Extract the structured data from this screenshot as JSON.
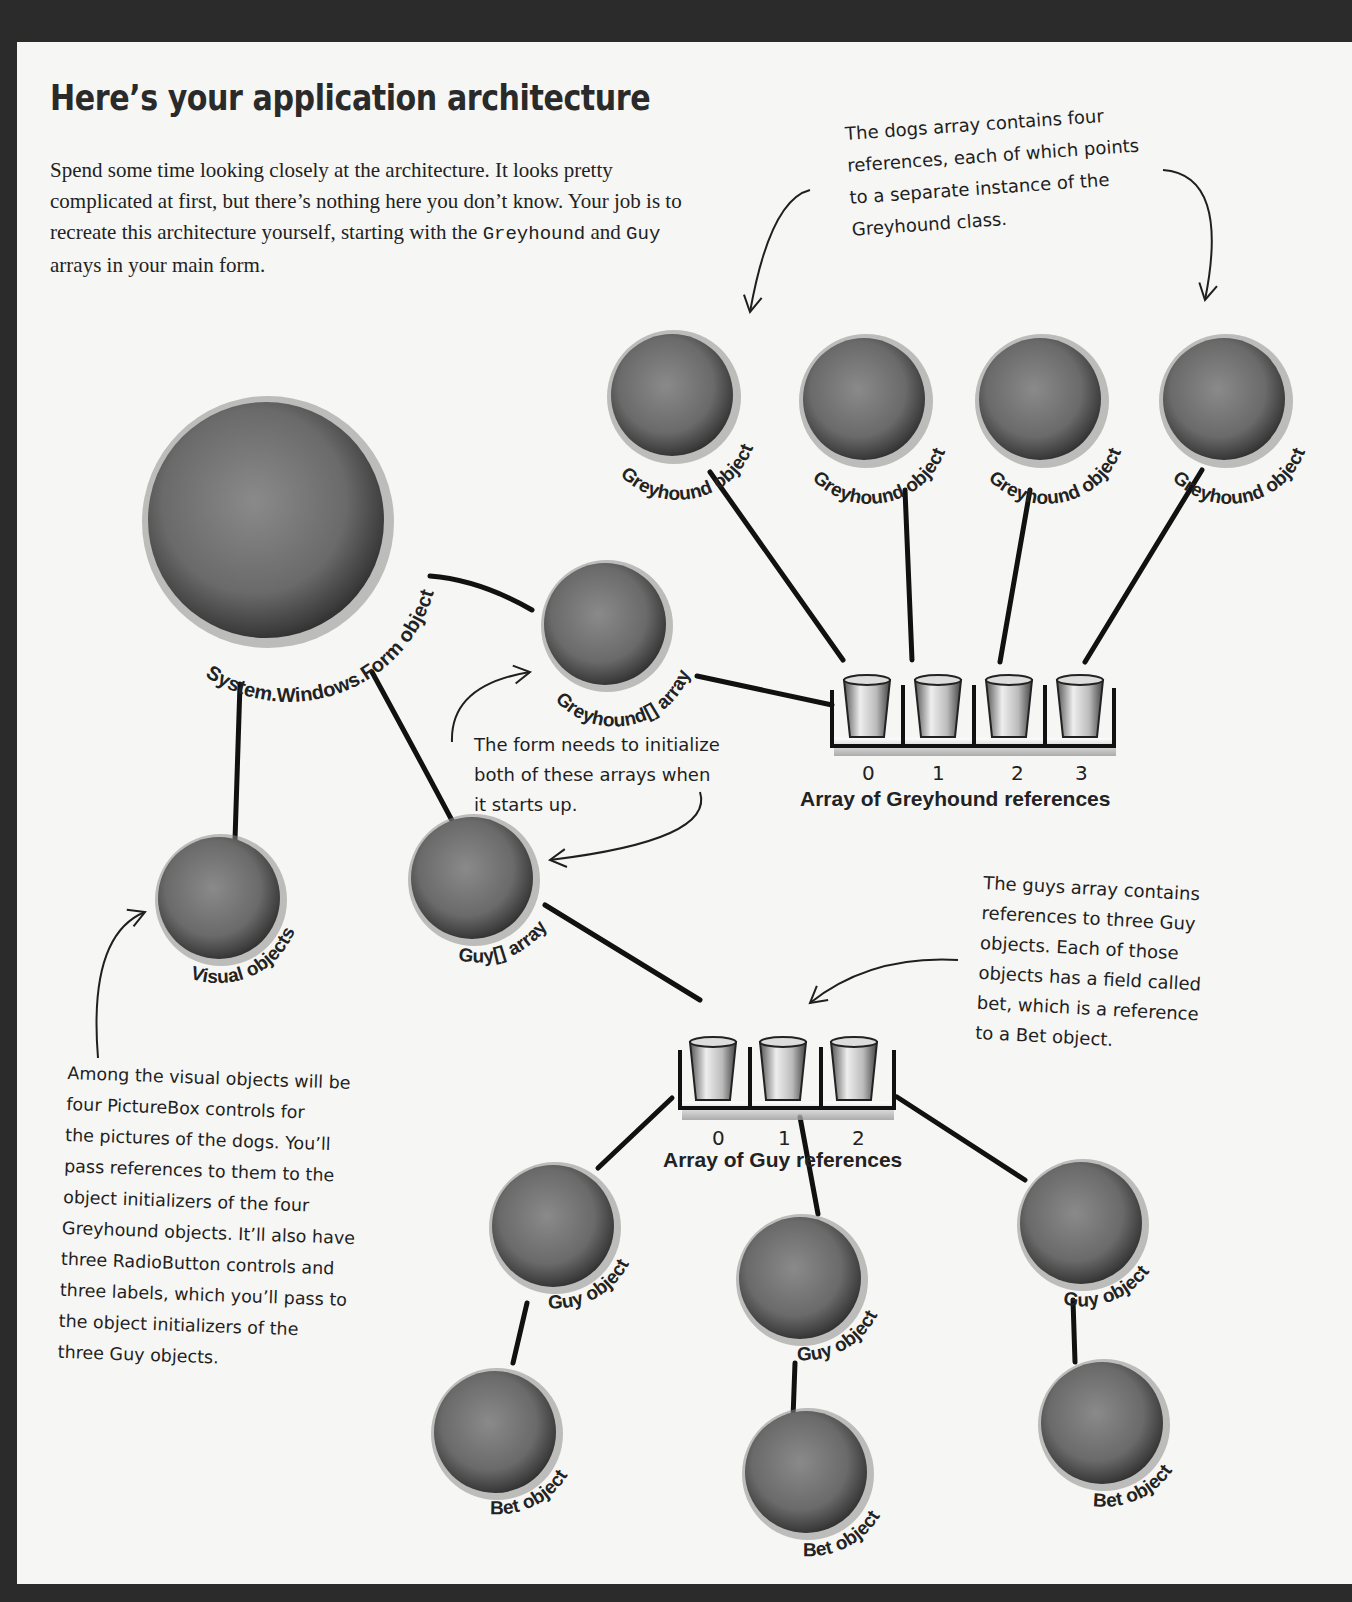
{
  "page": {
    "title": "Here’s your application architecture",
    "intro": {
      "part1": "Spend some time looking closely at the architecture. It looks pretty complicated at first, but there’s nothing here you don’t know. Your job is to recreate this architecture yourself, starting with the ",
      "code1": "Greyhound",
      "part2": " and ",
      "code2": "Guy",
      "part3": " arrays in your main form."
    }
  },
  "notes": {
    "dogs_array": [
      "The dogs array contains four",
      "references, each of which points",
      "to a separate instance of the",
      "Greyhound class."
    ],
    "form_init": [
      "The form needs to initialize",
      "both of these arrays when",
      "it starts up."
    ],
    "guys_array": [
      "The guys array contains",
      "references to three Guy",
      "objects. Each of those",
      "objects has a field called",
      "bet, which is a reference",
      "to a Bet object."
    ],
    "visual_objects": [
      "Among the visual objects will be",
      "four PictureBox controls for",
      "the pictures of the dogs. You’ll",
      "pass references to them to the",
      "object initializers of the four",
      "Greyhound objects. It’ll also have",
      "three RadioButton controls and",
      "three labels, which you’ll pass to",
      "the object initializers of the",
      "three Guy objects."
    ]
  },
  "nodes": {
    "form": "System.Windows.Form object",
    "visual": "Visual objects",
    "greyhound_array": "Greyhound[] array",
    "guy_array": "Guy[] array",
    "greyhounds": [
      "Greyhound object",
      "Greyhound object",
      "Greyhound object",
      "Greyhound object"
    ],
    "guys": [
      "Guy object",
      "Guy object",
      "Guy object"
    ],
    "bets": [
      "Bet object",
      "Bet object",
      "Bet object"
    ]
  },
  "arrays": {
    "greyhound_refs": {
      "label": "Array of Greyhound references",
      "indices": [
        "0",
        "1",
        "2",
        "3"
      ]
    },
    "guy_refs": {
      "label": "Array of Guy references",
      "indices": [
        "0",
        "1",
        "2"
      ]
    }
  },
  "colors": {
    "background_frame": "#2b2b2b",
    "page": "#f6f6f4",
    "circle_fill": "#6e6e6e",
    "circle_edge": "#3a3a3a",
    "ink": "#1f1f1f"
  }
}
